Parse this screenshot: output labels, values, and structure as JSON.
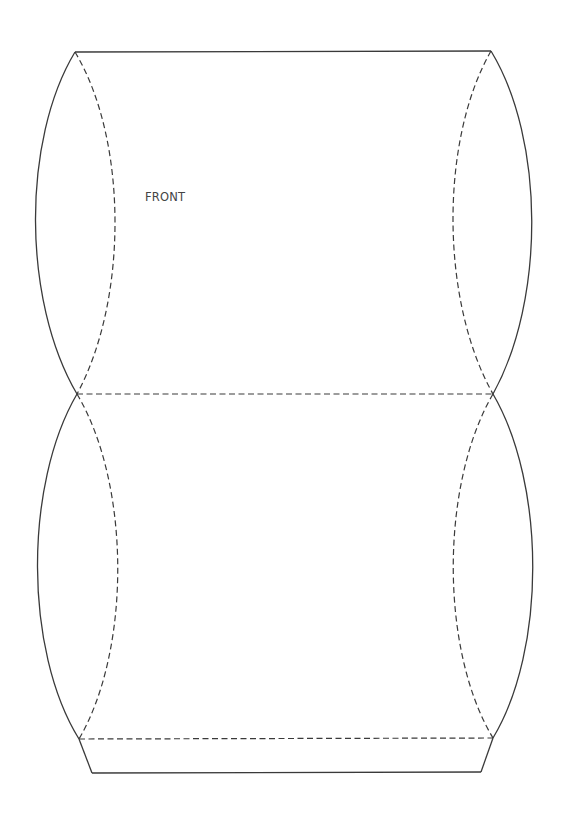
{
  "diagram": {
    "type": "pillow-box-template",
    "panel_label": "FRONT",
    "line_color": "#3a3a3a",
    "background": "#ffffff",
    "legend": {
      "cut_lines": "solid",
      "fold_lines": "dashed"
    },
    "points": {
      "top_left": [
        75,
        52
      ],
      "top_right": [
        491,
        51
      ],
      "mid_left": [
        77,
        394
      ],
      "mid_right": [
        493,
        394
      ],
      "glue_left": [
        79,
        739
      ],
      "glue_right": [
        493,
        738
      ],
      "bottom_left": [
        92,
        773
      ],
      "bottom_right": [
        481,
        772
      ]
    },
    "footer_text": ""
  }
}
